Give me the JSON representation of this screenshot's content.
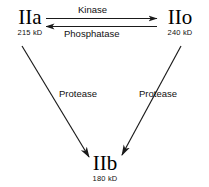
{
  "diagram": {
    "type": "reaction-scheme",
    "background_color": "#ffffff",
    "stroke_color": "#1a1a1a",
    "text_color": "#111111",
    "nodes": [
      {
        "id": "iia",
        "name": "IIa",
        "mass": "215 kD",
        "position": "top-left"
      },
      {
        "id": "iio",
        "name": "IIo",
        "mass": "240 kD",
        "position": "top-right"
      },
      {
        "id": "iib",
        "name": "IIb",
        "mass": "180  kD",
        "position": "bottom-center"
      }
    ],
    "edges": [
      {
        "id": "kinase",
        "label": "Kinase",
        "from": "iia",
        "to": "iio",
        "direction": "right"
      },
      {
        "id": "phosphatase",
        "label": "Phosphatase",
        "from": "iio",
        "to": "iia",
        "direction": "left"
      },
      {
        "id": "protease-left",
        "label": "Protease",
        "from": "iia",
        "to": "iib",
        "direction": "down-right"
      },
      {
        "id": "protease-right",
        "label": "Protease",
        "from": "iio",
        "to": "iib",
        "direction": "down-left"
      }
    ]
  }
}
